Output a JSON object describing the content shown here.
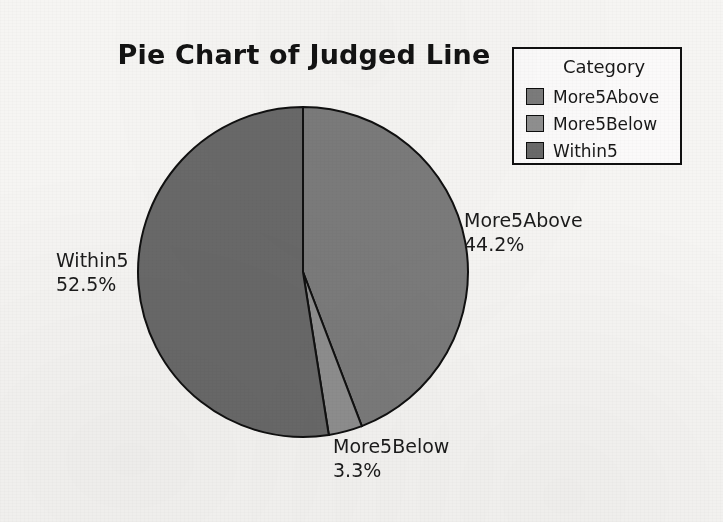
{
  "chart_data": {
    "type": "pie",
    "title": "Pie Chart of Judged Line",
    "categories": [
      "More5Above",
      "More5Below",
      "Within5"
    ],
    "values": [
      44.2,
      3.3,
      52.5
    ],
    "value_unit": "%",
    "slice_colors": [
      "#7b7b7b",
      "#8f8f8f",
      "#696969"
    ],
    "start_angle_deg": 0,
    "direction": "clockwise",
    "legend_position": "top-right",
    "grid": false,
    "xlabel": "",
    "ylabel": "",
    "slices": [
      {
        "name": "More5Above",
        "percent": "44.2%",
        "value": 44.2,
        "color": "#7b7b7b"
      },
      {
        "name": "More5Below",
        "percent": "3.3%",
        "value": 3.3,
        "color": "#8f8f8f"
      },
      {
        "name": "Within5",
        "percent": "52.5%",
        "value": 52.5,
        "color": "#696969"
      }
    ]
  },
  "title": "Pie Chart of Judged Line",
  "legend": {
    "heading": "Category",
    "items": [
      {
        "label": "More5Above",
        "color": "#7b7b7b"
      },
      {
        "label": "More5Below",
        "color": "#8f8f8f"
      },
      {
        "label": "Within5",
        "color": "#696969"
      }
    ]
  },
  "labels": {
    "more5above": {
      "name": "More5Above",
      "percent": "44.2%"
    },
    "within5": {
      "name": "Within5",
      "percent": "52.5%"
    },
    "more5below": {
      "name": "More5Below",
      "percent": "3.3%"
    }
  },
  "colors": {
    "background": "#f6f5f3",
    "outline": "#101010",
    "text": "#1b1b1b"
  }
}
